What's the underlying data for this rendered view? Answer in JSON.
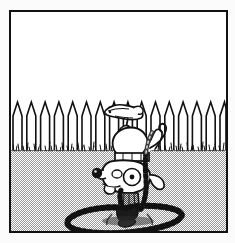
{
  "panel": {
    "title": "Dog handstand comic panel",
    "description": "Black and white comic panel: a cartoon dog doing a handstand upside down in a backyard, chained to a stake in the ground, with a picket fence behind it.",
    "border_color": "#111111",
    "outer_background": "#fbfbfb",
    "frame": {
      "x": 9,
      "y": 10,
      "width": 219,
      "height": 223,
      "border_width": 2
    }
  },
  "scene": {
    "sky": {
      "label": "sky",
      "color": "#ffffff",
      "top": 0,
      "bottom": 138
    },
    "horizon": {
      "label": "grass-line",
      "y": 138
    },
    "ground": {
      "label": "ground",
      "pattern": "dither-checker",
      "fill_light": "#ffffff",
      "fill_dark": "#9a9a9a",
      "top": 138,
      "bottom": 219
    },
    "fence": {
      "label": "picket-fence",
      "picket_count": 16,
      "picket_color": "#ffffff",
      "outline_color": "#111111",
      "top_y": 88,
      "base_y": 139,
      "point_height": 16,
      "picket_width": 9,
      "spacing": 13.8,
      "start_x": 2
    },
    "grass": {
      "label": "grass-tufts",
      "color": "#111111",
      "y": 138,
      "tuft_count": 46
    }
  },
  "dog": {
    "label": "cartoon-dog-handstand",
    "pose": "handstand-upside-down",
    "outline_color": "#111111",
    "body_fill": "#ffffff",
    "parts": [
      "rear-head-profile",
      "hind-legs",
      "tail",
      "torso",
      "collar",
      "head-upside-down",
      "nose",
      "eye",
      "ear",
      "front-paws"
    ],
    "nose_color": "#111111",
    "collar_color": "#ffffff"
  },
  "chain": {
    "label": "dog-chain",
    "link_color": "#3a3a3a",
    "highlight_color": "#dddddd",
    "loop_center_x": 114,
    "loop_center_y": 198,
    "loop_radius_x": 62,
    "loop_radius_y": 20,
    "link_count": 40,
    "stake": {
      "label": "ground-stake",
      "x": 112,
      "y": 170,
      "width": 18,
      "height": 38,
      "color": "#111111"
    }
  }
}
